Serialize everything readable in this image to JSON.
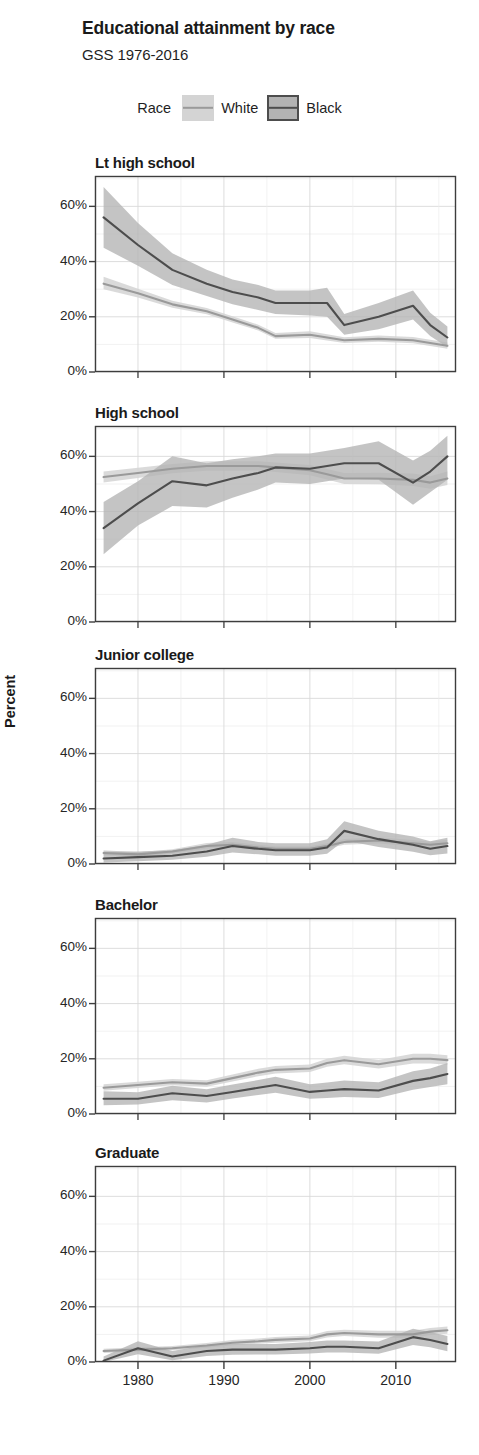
{
  "header": {
    "title": "Educational attainment by race",
    "subtitle": "GSS 1976-2016"
  },
  "legend": {
    "title": "Race",
    "items": [
      {
        "label": "White",
        "band_color": "#d4d4d4",
        "line_color": "#9a9a9a"
      },
      {
        "label": "Black",
        "band_color": "#b3b3b3",
        "line_color": "#4d4d4d"
      }
    ]
  },
  "axes": {
    "ylabel": "Percent",
    "yticks": [
      "0%",
      "20%",
      "40%",
      "60%"
    ],
    "xticks": [
      "1980",
      "1990",
      "2000",
      "2010"
    ]
  },
  "chart_data": {
    "type": "line",
    "title": "Educational attainment by race",
    "subtitle": "GSS 1976-2016",
    "xlabel": "",
    "ylabel": "Percent",
    "xlim": [
      1975,
      2017
    ],
    "ylim": [
      0,
      71
    ],
    "grid": true,
    "legend_position": "top-center",
    "legend_title": "Race",
    "x": [
      1976,
      1980,
      1984,
      1988,
      1991,
      1994,
      1996,
      2000,
      2002,
      2004,
      2008,
      2012,
      2014,
      2016
    ],
    "xticks": [
      1980,
      1990,
      2000,
      2010
    ],
    "yticks": [
      0,
      20,
      40,
      60
    ],
    "ytick_labels": [
      "0%",
      "20%",
      "40%",
      "60%"
    ],
    "panels": [
      {
        "title": "Lt high school",
        "series": [
          {
            "name": "White",
            "color": "#9a9a9a",
            "band_color": "#d4d4d4",
            "values": [
              32.0,
              28.5,
              24.5,
              22.0,
              19.0,
              16.0,
              13.0,
              13.5,
              12.5,
              11.5,
              12.0,
              11.5,
              10.5,
              9.5
            ],
            "lower": [
              30.0,
              27.0,
              23.3,
              20.9,
              17.9,
              15.0,
              12.0,
              12.3,
              11.4,
              10.5,
              11.0,
              10.4,
              9.4,
              8.4
            ],
            "upper": [
              34.5,
              30.2,
              25.8,
              23.2,
              20.2,
              17.1,
              14.1,
              14.8,
              13.7,
              12.6,
              13.2,
              12.7,
              11.7,
              10.7
            ]
          },
          {
            "name": "Black",
            "color": "#4d4d4d",
            "band_color": "#b3b3b3",
            "values": [
              56.0,
              46.0,
              37.0,
              32.0,
              29.0,
              27.0,
              25.0,
              25.0,
              25.0,
              17.0,
              20.0,
              24.0,
              17.0,
              12.5
            ],
            "lower": [
              45.0,
              38.5,
              31.5,
              27.5,
              24.5,
              22.5,
              21.0,
              20.5,
              20.0,
              13.5,
              15.5,
              19.0,
              13.0,
              9.0
            ],
            "upper": [
              67.0,
              54.0,
              43.0,
              37.0,
              33.5,
              31.5,
              29.5,
              29.5,
              30.5,
              21.0,
              25.0,
              29.5,
              21.5,
              16.5
            ]
          }
        ]
      },
      {
        "title": "High school",
        "series": [
          {
            "name": "White",
            "color": "#9a9a9a",
            "band_color": "#d4d4d4",
            "values": [
              52.5,
              54.0,
              55.5,
              56.5,
              56.5,
              56.5,
              56.0,
              55.0,
              53.5,
              52.0,
              52.0,
              51.5,
              50.5,
              52.0
            ],
            "lower": [
              50.5,
              52.2,
              53.9,
              54.8,
              54.8,
              54.9,
              54.3,
              53.2,
              51.6,
              50.0,
              49.9,
              49.3,
              48.3,
              49.6
            ],
            "upper": [
              54.5,
              55.9,
              57.2,
              58.2,
              58.2,
              58.2,
              57.8,
              56.9,
              55.4,
              54.0,
              54.1,
              53.8,
              52.8,
              54.5
            ]
          },
          {
            "name": "Black",
            "color": "#4d4d4d",
            "band_color": "#b3b3b3",
            "values": [
              34.0,
              43.0,
              51.0,
              49.5,
              52.0,
              54.0,
              56.0,
              55.5,
              56.5,
              57.5,
              57.5,
              50.5,
              54.5,
              60.0
            ],
            "lower": [
              24.5,
              35.0,
              42.0,
              41.5,
              45.0,
              48.0,
              50.5,
              50.0,
              51.0,
              52.0,
              51.5,
              42.5,
              47.0,
              51.5
            ],
            "upper": [
              43.5,
              51.0,
              60.0,
              57.5,
              59.0,
              60.0,
              61.0,
              61.0,
              62.0,
              63.0,
              65.5,
              58.5,
              62.0,
              67.5
            ]
          }
        ]
      },
      {
        "title": "Junior college",
        "series": [
          {
            "name": "White",
            "color": "#9a9a9a",
            "band_color": "#d4d4d4",
            "values": [
              4.0,
              3.5,
              4.5,
              6.5,
              7.0,
              6.0,
              5.5,
              5.5,
              6.5,
              8.0,
              8.5,
              7.5,
              7.0,
              7.5
            ],
            "lower": [
              3.2,
              2.8,
              3.8,
              5.6,
              6.1,
              5.2,
              4.7,
              4.7,
              5.6,
              7.0,
              7.4,
              6.4,
              6.0,
              6.3
            ],
            "upper": [
              5.0,
              4.3,
              5.3,
              7.6,
              8.0,
              7.0,
              6.4,
              6.4,
              7.5,
              9.1,
              9.7,
              8.7,
              8.1,
              8.8
            ]
          },
          {
            "name": "Black",
            "color": "#4d4d4d",
            "band_color": "#b3b3b3",
            "values": [
              2.0,
              2.5,
              3.0,
              4.5,
              6.5,
              5.5,
              5.0,
              5.0,
              6.0,
              12.0,
              9.0,
              7.0,
              5.5,
              6.5
            ],
            "lower": [
              0.5,
              1.0,
              1.5,
              2.6,
              4.2,
              3.5,
              3.0,
              3.0,
              3.7,
              8.5,
              6.2,
              4.4,
              3.2,
              3.8
            ],
            "upper": [
              4.5,
              4.5,
              5.0,
              7.0,
              9.5,
              8.0,
              7.5,
              7.5,
              9.0,
              15.5,
              12.0,
              10.0,
              8.2,
              9.5
            ]
          }
        ]
      },
      {
        "title": "Bachelor",
        "series": [
          {
            "name": "White",
            "color": "#9a9a9a",
            "band_color": "#d4d4d4",
            "values": [
              9.5,
              10.5,
              11.5,
              11.0,
              13.0,
              15.0,
              16.0,
              16.5,
              18.5,
              19.5,
              18.0,
              20.0,
              20.0,
              19.5
            ],
            "lower": [
              8.4,
              9.4,
              10.4,
              9.9,
              11.8,
              13.7,
              14.7,
              15.2,
              17.1,
              18.0,
              16.5,
              18.3,
              18.3,
              17.8
            ],
            "upper": [
              10.8,
              11.7,
              12.7,
              12.2,
              14.3,
              16.4,
              17.4,
              17.9,
              20.0,
              21.1,
              19.6,
              21.8,
              21.8,
              21.3
            ]
          },
          {
            "name": "Black",
            "color": "#4d4d4d",
            "band_color": "#b3b3b3",
            "values": [
              5.5,
              5.5,
              7.5,
              6.5,
              8.0,
              9.5,
              10.5,
              8.0,
              8.5,
              9.0,
              8.5,
              12.0,
              13.0,
              14.5
            ],
            "lower": [
              3.2,
              3.4,
              5.0,
              4.2,
              5.6,
              6.9,
              7.7,
              5.5,
              5.8,
              6.2,
              5.8,
              8.8,
              9.8,
              10.8
            ],
            "upper": [
              8.2,
              7.9,
              10.2,
              9.0,
              10.7,
              12.3,
              13.5,
              10.8,
              11.4,
              12.1,
              11.5,
              15.5,
              16.5,
              18.5
            ]
          }
        ]
      },
      {
        "title": "Graduate",
        "series": [
          {
            "name": "White",
            "color": "#9a9a9a",
            "band_color": "#d4d4d4",
            "values": [
              4.0,
              4.5,
              5.0,
              6.0,
              7.0,
              7.5,
              8.0,
              8.5,
              10.0,
              10.5,
              10.0,
              10.0,
              11.0,
              11.5
            ],
            "lower": [
              3.3,
              3.8,
              4.3,
              5.2,
              6.1,
              6.6,
              7.0,
              7.5,
              8.9,
              9.4,
              8.8,
              8.8,
              9.8,
              10.2
            ],
            "upper": [
              4.8,
              5.3,
              5.8,
              6.9,
              8.0,
              8.5,
              9.1,
              9.6,
              11.2,
              11.7,
              11.3,
              11.3,
              12.3,
              12.9
            ]
          },
          {
            "name": "Black",
            "color": "#4d4d4d",
            "band_color": "#b3b3b3",
            "values": [
              0.5,
              5.0,
              2.0,
              4.0,
              4.5,
              4.5,
              4.5,
              5.0,
              5.5,
              5.5,
              5.0,
              9.0,
              8.0,
              6.5
            ],
            "lower": [
              0.0,
              2.8,
              0.6,
              2.2,
              2.6,
              2.7,
              2.7,
              3.1,
              3.4,
              3.4,
              3.0,
              6.2,
              5.3,
              3.9
            ],
            "upper": [
              2.0,
              7.5,
              4.0,
              6.2,
              6.6,
              6.5,
              6.5,
              7.2,
              7.8,
              7.8,
              7.4,
              12.0,
              10.9,
              9.4
            ]
          }
        ]
      }
    ]
  }
}
